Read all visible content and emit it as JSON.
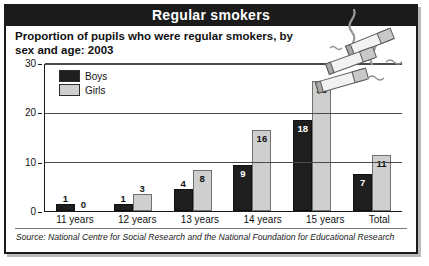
{
  "banner": {
    "title": "Regular smokers"
  },
  "subtitle": "Proportion of pupils who were regular smokers, by sex and age: 2003",
  "source": "Source: National Centre for Social Research and the National Foundation for Educational Research",
  "legend": {
    "boys": "Boys",
    "girls": "Girls"
  },
  "colors": {
    "boys": "#1e1e1e",
    "girls": "#cfcfcf",
    "banner": "#1b1b1b",
    "grid": "#4a4a4a"
  },
  "art": {
    "name": "cigarettes-illustration"
  },
  "chart_data": {
    "type": "bar",
    "title": "Proportion of pupils who were regular smokers, by sex and age: 2003",
    "xlabel": "",
    "ylabel": "",
    "ylim": [
      0,
      30
    ],
    "yticks": [
      0,
      10,
      20,
      30
    ],
    "grid": true,
    "legend_position": "top-left",
    "categories": [
      "11 years",
      "12 years",
      "13 years",
      "14 years",
      "15 years",
      "Total"
    ],
    "series": [
      {
        "name": "Boys",
        "values": [
          1,
          1,
          4,
          9,
          18,
          7
        ]
      },
      {
        "name": "Girls",
        "values": [
          0,
          3,
          8,
          16,
          26,
          11
        ]
      }
    ]
  }
}
